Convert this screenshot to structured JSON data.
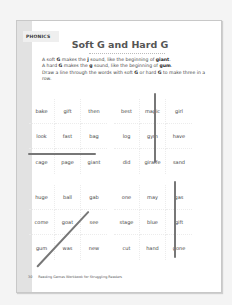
{
  "section_tag": "PHONICS",
  "title": "Soft G and Hard G",
  "instructions": {
    "line1_pre": "A soft ",
    "line1_g": "G",
    "line1_mid": " makes the ",
    "line1_j": "j",
    "line1_post": " sound, like the beginning of ",
    "line1_word": "giant",
    "line1_end": ".",
    "line2_pre": "A hard ",
    "line2_g": "G",
    "line2_mid": " makes the ",
    "line2_g2": "g",
    "line2_post": " sound, like the beginning of ",
    "line2_word": "gum",
    "line2_end": ".",
    "line3_pre": "Draw a line through the words with soft ",
    "line3_g": "G",
    "line3_mid": " or hard ",
    "line3_g2": "G",
    "line3_post": " to make three in a row."
  },
  "grids": [
    {
      "words": [
        "bake",
        "gift",
        "then",
        "look",
        "fast",
        "bag",
        "cage",
        "page",
        "giant"
      ]
    },
    {
      "words": [
        "best",
        "magic",
        "girl",
        "log",
        "gym",
        "have",
        "did",
        "giraffe",
        "sand"
      ]
    },
    {
      "words": [
        "huge",
        "ball",
        "gab",
        "come",
        "goat",
        "see",
        "gum",
        "was",
        "new"
      ]
    },
    {
      "words": [
        "one",
        "may",
        "gas",
        "stage",
        "blue",
        "gift",
        "cut",
        "hand",
        "gone"
      ]
    }
  ],
  "footer": {
    "page_number": "30",
    "book_title": "Reading Games Workbook for Struggling Readers"
  }
}
